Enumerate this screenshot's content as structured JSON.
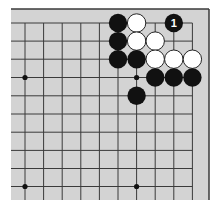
{
  "board": {
    "background": "#d3d3d3",
    "line_color": "#3a3a3a",
    "frame": {
      "left": 11,
      "top": 9,
      "right": 209,
      "bottom": 200
    },
    "grid": {
      "x": [
        25,
        43.6,
        62.2,
        80.8,
        99.4,
        118,
        136.6,
        155.2,
        173.8,
        192.4
      ],
      "y": [
        23,
        41.1,
        59.2,
        77.5,
        95.8,
        114,
        132.2,
        150.4,
        168.5,
        186.5
      ]
    },
    "star_points": [
      [
        0,
        3
      ],
      [
        6,
        3
      ],
      [
        0,
        9
      ],
      [
        6,
        9
      ]
    ],
    "stones": [
      {
        "col": 5,
        "row": 0,
        "color": "black"
      },
      {
        "col": 6,
        "row": 0,
        "color": "white"
      },
      {
        "col": 8,
        "row": 0,
        "color": "black",
        "label": "1"
      },
      {
        "col": 5,
        "row": 1,
        "color": "black"
      },
      {
        "col": 6,
        "row": 1,
        "color": "white"
      },
      {
        "col": 7,
        "row": 1,
        "color": "white"
      },
      {
        "col": 5,
        "row": 2,
        "color": "black"
      },
      {
        "col": 6,
        "row": 2,
        "color": "black"
      },
      {
        "col": 7,
        "row": 2,
        "color": "white"
      },
      {
        "col": 8,
        "row": 2,
        "color": "white"
      },
      {
        "col": 9,
        "row": 2,
        "color": "white"
      },
      {
        "col": 7,
        "row": 3,
        "color": "black"
      },
      {
        "col": 8,
        "row": 3,
        "color": "black"
      },
      {
        "col": 9,
        "row": 3,
        "color": "black"
      },
      {
        "col": 6,
        "row": 4,
        "color": "black"
      }
    ]
  }
}
